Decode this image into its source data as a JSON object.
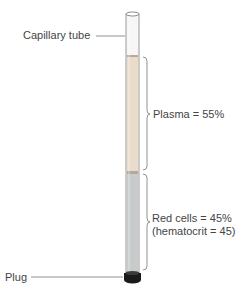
{
  "diagram": {
    "labels": {
      "tube": "Capillary tube",
      "plasma": "Plasma = 55%",
      "red_cells_line1": "Red cells = 45%",
      "red_cells_line2": "(hematocrit = 45)",
      "plug": "Plug"
    },
    "fractions": {
      "plasma_percent": 55,
      "red_cells_percent": 45,
      "hematocrit": 45
    },
    "colors": {
      "plasma": "#e9dccb",
      "red_cells": "#c8cbcb",
      "tube_outline": "#9a9a9a",
      "plug": "#1a1a1a"
    }
  }
}
